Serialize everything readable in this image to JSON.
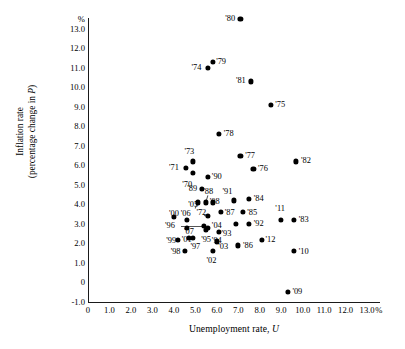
{
  "chart_data": {
    "type": "scatter",
    "title": "",
    "xlabel": "Unemployment rate, U",
    "ylabel_line1": "Inflation rate",
    "ylabel_line2": "(percentage change in P)",
    "x_unit": "%",
    "y_unit": "%",
    "xlim": [
      0,
      13.6
    ],
    "ylim": [
      -1.0,
      13.6
    ],
    "grid": false,
    "legend": "none",
    "xticks": [
      "0",
      "1.0",
      "2.0",
      "3.0",
      "4.0",
      "5.0",
      "6.0",
      "7.0",
      "8.0",
      "9.0",
      "10.0",
      "11.0",
      "12.0",
      "13.0"
    ],
    "xtick_values": [
      0,
      1,
      2,
      3,
      4,
      5,
      6,
      7,
      8,
      9,
      10,
      11,
      12,
      13
    ],
    "yticks": [
      "13.0",
      "12.0",
      "11.0",
      "10.0",
      "9.0",
      "8.0",
      "7.0",
      "6.0",
      "5.0",
      "4.0",
      "3.0",
      "2.0",
      "1.0",
      "0",
      "-1.0"
    ],
    "ytick_values": [
      13,
      12,
      11,
      10,
      9,
      8,
      7,
      6,
      5,
      4,
      3,
      2,
      1,
      0,
      -1
    ],
    "points": [
      {
        "label": "'70",
        "x": 4.9,
        "y": 5.6,
        "lx": 4.62,
        "ly": 5.0
      },
      {
        "label": "'71",
        "x": 5.9,
        "y": 3.3,
        "lx": 4.18,
        "ly": 5.9,
        "override": {
          "px": 4.55,
          "py": 5.85,
          "lpx": 4.0,
          "lpy": 5.86
        }
      },
      {
        "label": "'72",
        "x": 5.6,
        "y": 3.4,
        "lx": 5.28,
        "ly": 3.55
      },
      {
        "label": "'73",
        "x": 4.9,
        "y": 6.2,
        "lx": 4.72,
        "ly": 6.7
      },
      {
        "label": "'74",
        "x": 5.6,
        "y": 11.0,
        "lx": 5.05,
        "ly": 11.0
      },
      {
        "label": "'75",
        "x": 8.5,
        "y": 9.1,
        "lx": 8.95,
        "ly": 9.1
      },
      {
        "label": "'76",
        "x": 7.7,
        "y": 5.8,
        "lx": 8.15,
        "ly": 5.8
      },
      {
        "label": "'77",
        "x": 7.1,
        "y": 6.5,
        "lx": 7.55,
        "ly": 6.5
      },
      {
        "label": "'78",
        "x": 6.1,
        "y": 7.6,
        "lx": 6.55,
        "ly": 7.6
      },
      {
        "label": "'79",
        "x": 5.8,
        "y": 11.3,
        "lx": 6.2,
        "ly": 11.3
      },
      {
        "label": "'80",
        "x": 7.1,
        "y": 13.5,
        "lx": 6.62,
        "ly": 13.5
      },
      {
        "label": "'81",
        "x": 7.6,
        "y": 10.3,
        "lx": 7.12,
        "ly": 10.3
      },
      {
        "label": "'82",
        "x": 9.7,
        "y": 6.2,
        "lx": 10.15,
        "ly": 6.2
      },
      {
        "label": "'83",
        "x": 9.6,
        "y": 3.2,
        "lx": 10.05,
        "ly": 3.2
      },
      {
        "label": "'84",
        "x": 7.5,
        "y": 4.3,
        "lx": 7.95,
        "ly": 4.3
      },
      {
        "label": "'85",
        "x": 7.2,
        "y": 3.6,
        "lx": 7.65,
        "ly": 3.55
      },
      {
        "label": "'86",
        "x": 7.0,
        "y": 1.9,
        "lx": 7.45,
        "ly": 1.85
      },
      {
        "label": "'87",
        "x": 6.2,
        "y": 3.6,
        "lx": 6.6,
        "ly": 3.55
      },
      {
        "label": "'88",
        "x": 5.5,
        "y": 4.1,
        "lx": 5.6,
        "ly": 4.62
      },
      {
        "label": "'89",
        "x": 5.3,
        "y": 4.8,
        "lx": 4.85,
        "ly": 4.78
      },
      {
        "label": "'90",
        "x": 5.6,
        "y": 5.4,
        "lx": 6.0,
        "ly": 5.4
      },
      {
        "label": "'91",
        "x": 6.8,
        "y": 4.2,
        "lx": 6.5,
        "ly": 4.62
      },
      {
        "label": "'92",
        "x": 7.5,
        "y": 3.0,
        "lx": 7.95,
        "ly": 3.0
      },
      {
        "label": "'93",
        "x": 6.9,
        "y": 3.0,
        "lx": 6.45,
        "ly": 2.5
      },
      {
        "label": "'94",
        "x": 6.1,
        "y": 2.6,
        "lx": 6.0,
        "ly": 2.15
      },
      {
        "label": "'95",
        "x": 5.6,
        "y": 2.8,
        "lx": 5.5,
        "ly": 2.2
      },
      {
        "label": "'96",
        "x": 5.4,
        "y": 2.9,
        "lx": 3.82,
        "ly": 2.9
      },
      {
        "label": "'97",
        "x": 4.9,
        "y": 2.3,
        "lx": 5.0,
        "ly": 1.8
      },
      {
        "label": "'98",
        "x": 4.5,
        "y": 1.6,
        "lx": 4.08,
        "ly": 1.55
      },
      {
        "label": "'99",
        "x": 4.2,
        "y": 2.2,
        "lx": 3.88,
        "ly": 2.15
      },
      {
        "label": "'00",
        "x": 4.0,
        "y": 3.4,
        "lx": 4.3,
        "ly": 3.52,
        "override": {
          "px": 4.0,
          "py": 3.38,
          "lpx": 4.0,
          "lpy": 3.52
        }
      },
      {
        "label": "'01",
        "x": 4.7,
        "y": 2.3,
        "lx": 4.6,
        "ly": 2.2
      },
      {
        "label": "'02",
        "x": 5.8,
        "y": 1.6,
        "lx": 5.75,
        "ly": 1.1
      },
      {
        "label": "'03",
        "x": 6.0,
        "y": 2.1,
        "lx": 6.3,
        "ly": 1.8
      },
      {
        "label": "'04",
        "x": 5.5,
        "y": 2.7,
        "lx": 6.0,
        "ly": 2.9
      },
      {
        "label": "'05",
        "x": 5.1,
        "y": 4.1,
        "lx": 4.9,
        "ly": 3.95
      },
      {
        "label": "'06",
        "x": 4.6,
        "y": 3.2,
        "lx": 4.55,
        "ly": 3.5
      },
      {
        "label": "'07",
        "x": 4.6,
        "y": 2.8,
        "lx": 4.7,
        "ly": 2.6
      },
      {
        "label": "'08",
        "x": 5.8,
        "y": 4.1,
        "lx": 5.9,
        "ly": 4.1
      },
      {
        "label": "'09",
        "x": 9.3,
        "y": -0.5,
        "lx": 9.75,
        "ly": -0.5
      },
      {
        "label": "'10",
        "x": 9.6,
        "y": 1.6,
        "lx": 10.05,
        "ly": 1.55
      },
      {
        "label": "'11",
        "x": 9.0,
        "y": 3.2,
        "lx": 8.95,
        "ly": 3.75
      },
      {
        "label": "'12",
        "x": 8.1,
        "y": 2.2,
        "lx": 8.5,
        "ly": 2.2
      }
    ],
    "leaders": [
      {
        "from_x": 4.35,
        "from_y": 2.9,
        "to_x": 5.4,
        "to_y": 2.9
      },
      {
        "from_x": 5.42,
        "from_y": 3.45,
        "to_x": 5.58,
        "to_y": 3.42
      },
      {
        "from_x": 5.6,
        "from_y": 4.5,
        "to_x": 5.5,
        "to_y": 4.15
      },
      {
        "from_x": 5.0,
        "from_y": 3.8,
        "to_x": 5.1,
        "to_y": 4.05
      }
    ]
  }
}
